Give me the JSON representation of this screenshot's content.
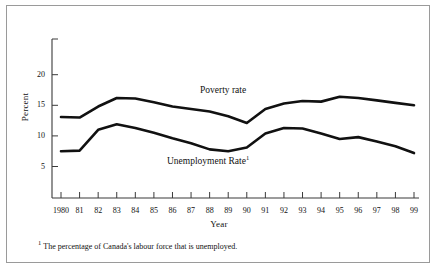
{
  "figure": {
    "ylabel": "Percent",
    "xlabel": "Year",
    "footnote_marker": "1",
    "footnote_text": "The percentage of Canada's labour force that is unemployed.",
    "series_labels": {
      "poverty": "Poverty rate",
      "unemployment": "Unemployment Rate",
      "unemployment_sup": "1"
    },
    "colors": {
      "line": "#111111",
      "axis": "#444444",
      "border": "#9a9a9a",
      "background": "#ffffff"
    }
  },
  "chart_data": {
    "type": "line",
    "title": "",
    "subtitle": "",
    "xlabel": "Year",
    "ylabel": "Percent",
    "grid": false,
    "legend": "inline-labels",
    "xlim": [
      1980,
      1999
    ],
    "ylim": [
      0,
      24
    ],
    "yticks": [
      5,
      10,
      15,
      20
    ],
    "ytick_labels": [
      "5",
      "10",
      "15",
      "20"
    ],
    "x": [
      1980,
      1981,
      1982,
      1983,
      1984,
      1985,
      1986,
      1987,
      1988,
      1989,
      1990,
      1991,
      1992,
      1993,
      1994,
      1995,
      1996,
      1997,
      1998,
      1999
    ],
    "xtick_labels": [
      "1980",
      "81",
      "82",
      "83",
      "84",
      "85",
      "86",
      "87",
      "88",
      "89",
      "90",
      "91",
      "92",
      "93",
      "94",
      "95",
      "96",
      "97",
      "98",
      "99"
    ],
    "series": [
      {
        "name": "Poverty rate",
        "values": [
          13.1,
          13.0,
          14.8,
          16.2,
          16.1,
          15.5,
          14.8,
          14.4,
          14.0,
          13.2,
          12.1,
          14.4,
          15.3,
          15.7,
          15.6,
          16.4,
          16.2,
          15.8,
          15.4,
          15.0
        ]
      },
      {
        "name": "Unemployment Rate",
        "values": [
          7.5,
          7.6,
          11.0,
          11.9,
          11.3,
          10.5,
          9.6,
          8.8,
          7.8,
          7.5,
          8.1,
          10.4,
          11.3,
          11.2,
          10.4,
          9.5,
          9.8,
          9.1,
          8.3,
          7.2
        ]
      }
    ],
    "annotations": [
      {
        "text": "Poverty rate",
        "x": 1989.0,
        "y": 17.9
      },
      {
        "text": "Unemployment Rate1",
        "x": 1987.2,
        "y": 6.0
      }
    ]
  }
}
